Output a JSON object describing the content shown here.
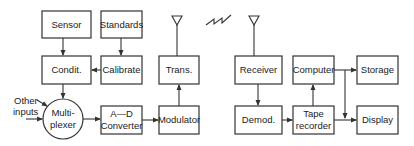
{
  "diagram": {
    "nodes": {
      "sensor": {
        "label": "Sensor"
      },
      "standards": {
        "label": "Standards"
      },
      "condit": {
        "label": "Condit."
      },
      "calibrate": {
        "label": "Calibrate"
      },
      "trans": {
        "label": "Trans."
      },
      "multiplexer": {
        "line1": "Multi-",
        "line2": "plexer"
      },
      "ad_converter": {
        "line1": "A—D",
        "line2": "Converter"
      },
      "modulator": {
        "label": "Modulator"
      },
      "receiver": {
        "label": "Receiver"
      },
      "demod": {
        "label": "Demod."
      },
      "computer": {
        "label": "Computer"
      },
      "tape_recorder": {
        "line1": "Tape",
        "line2": "recorder"
      },
      "storage": {
        "label": "Storage"
      },
      "display": {
        "label": "Display"
      }
    },
    "other_inputs": {
      "line1": "Other",
      "line2": "inputs"
    },
    "edges": [
      [
        "Sensor",
        "Condit."
      ],
      [
        "Standards",
        "Calibrate"
      ],
      [
        "Calibrate",
        "Condit."
      ],
      [
        "Condit.",
        "Multiplexer"
      ],
      [
        "Other inputs",
        "Multiplexer"
      ],
      [
        "Multiplexer",
        "A-D Converter"
      ],
      [
        "A-D Converter",
        "Modulator"
      ],
      [
        "Modulator",
        "Trans."
      ],
      [
        "Trans.",
        "Antenna"
      ],
      [
        "Antenna",
        "Receiver"
      ],
      [
        "Receiver",
        "Demod."
      ],
      [
        "Demod.",
        "Tape recorder"
      ],
      [
        "Tape recorder",
        "Computer"
      ],
      [
        "Computer",
        "Storage"
      ],
      [
        "Computer",
        "Display"
      ],
      [
        "Tape recorder",
        "Display"
      ]
    ]
  }
}
